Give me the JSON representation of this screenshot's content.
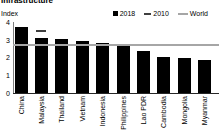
{
  "title": "Infrastructure",
  "ylabel": "Index",
  "chart_data": {
    "type": "bar",
    "title": "Infrastructure",
    "ylabel": "Index",
    "ylim": [
      0,
      4
    ],
    "yticks": [
      0,
      1,
      2,
      3,
      4
    ],
    "grid": false,
    "legend_position": "top-right",
    "categories": [
      "China",
      "Malaysia",
      "Thailand",
      "Vietnam",
      "Indonesia",
      "Philippines",
      "Lao PDR",
      "Cambodia",
      "Mongolia",
      "Myanmar"
    ],
    "series": [
      {
        "name": "2018",
        "type": "bar",
        "color": "#000000",
        "values": [
          3.75,
          3.15,
          3.05,
          2.95,
          2.85,
          2.65,
          2.4,
          2.05,
          2.0,
          1.85
        ]
      },
      {
        "name": "2010",
        "type": "tick-marker",
        "color": "#3f3f3f",
        "values": [
          null,
          3.55,
          null,
          null,
          null,
          null,
          null,
          null,
          null,
          null
        ]
      },
      {
        "name": "World",
        "type": "reference-line",
        "color": "#a6a6a6",
        "value": 2.7
      }
    ]
  }
}
